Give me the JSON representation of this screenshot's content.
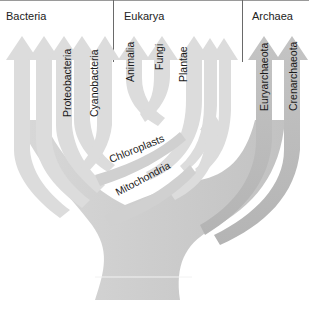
{
  "domains": [
    {
      "name": "Bacteria",
      "x": 6
    },
    {
      "name": "Eukarya",
      "x": 124
    },
    {
      "name": "Archaea",
      "x": 252
    }
  ],
  "groups": {
    "bacteria": [
      "Proteobacteria",
      "Cyanobacteria"
    ],
    "eukarya": [
      "Animalia",
      "Fungi",
      "Plantae"
    ],
    "archaea": [
      "Euryarchaeota",
      "Crenarchaeota"
    ]
  },
  "endosymbiosis": {
    "chloroplasts": "Chloroplasts",
    "mitochondria": "Mitochondria"
  },
  "colors": {
    "light_branch": "#dcdcdc",
    "dark_branch": "#b9b9b9",
    "divider": "#6a6a6a",
    "text": "#1a1a1a"
  }
}
